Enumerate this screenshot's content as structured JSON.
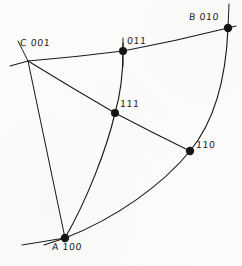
{
  "figure": {
    "kind": "stereographic-projection",
    "background_color": "#fcfcfb",
    "ink_color": "#1b1b1b",
    "width": 242,
    "height": 266
  },
  "poles": [
    {
      "id": "c-001",
      "label": "C 001",
      "index": "001",
      "letter": "C",
      "x": 28,
      "y": 61,
      "marker_radius": 4.0,
      "label_x": 20,
      "label_y": 38
    },
    {
      "id": "011",
      "label": "011",
      "index": "011",
      "letter": "",
      "x": 123,
      "y": 51,
      "marker_radius": 4.0,
      "label_x": 127,
      "label_y": 36
    },
    {
      "id": "b-010",
      "label": "B 010",
      "index": "010",
      "letter": "B",
      "x": 228,
      "y": 28,
      "marker_radius": 4.2,
      "label_x": 189,
      "label_y": 12
    },
    {
      "id": "111",
      "label": "111",
      "index": "111",
      "letter": "",
      "x": 115,
      "y": 113,
      "marker_radius": 4.0,
      "label_x": 120,
      "label_y": 99
    },
    {
      "id": "110",
      "label": "110",
      "index": "110",
      "letter": "",
      "x": 190,
      "y": 151,
      "marker_radius": 4.2,
      "label_x": 196,
      "label_y": 140
    },
    {
      "id": "a-100",
      "label": "A 100",
      "index": "100",
      "letter": "A",
      "x": 65,
      "y": 238,
      "marker_radius": 4.2,
      "label_x": 52,
      "label_y": 242
    }
  ],
  "arcs": [
    {
      "id": "arc-c-011-b",
      "name": "great-circle-c-to-b",
      "from": "c-001",
      "through": "011",
      "to": "b-010",
      "path": "M 10 66 L 28 61 Q 76 57 123 51 Q 176 41 228 28 L 236 26"
    },
    {
      "id": "arc-b-110-a",
      "name": "great-circle-b-to-a",
      "from": "b-010",
      "through": "110",
      "to": "a-100",
      "path": "M 228 28 C 226 78 214 122 190 151 C 163 184 117 218 65 238 L 44 245"
    },
    {
      "id": "arc-011-111-a",
      "name": "great-circle-011-to-a",
      "from": "011",
      "through": "111",
      "to": "a-100",
      "path": "M 123 43 L 123 51 C 123 72 120 96 115 113 C 107 148 87 200 65 238"
    }
  ],
  "lines": [
    {
      "id": "line-c-111-110",
      "name": "zone-line-c-to-110",
      "from": "c-001",
      "through": "111",
      "to": "110",
      "path": "M 28 61 Q 72 88 115 113 Q 153 133 190 151"
    },
    {
      "id": "line-c-a",
      "name": "zone-line-c-to-a",
      "from": "c-001",
      "to": "a-100",
      "path": "M 28 61 L 65 238"
    }
  ],
  "tick_marks": [
    {
      "id": "tick-b-vertical",
      "name": "tick-at-b-010",
      "path": "M 229 4 L 228 28"
    },
    {
      "id": "tick-011-vertical",
      "name": "tick-at-011",
      "path": "M 123 38 L 123 66"
    },
    {
      "id": "tick-c-upleft",
      "name": "tick-at-c-001",
      "path": "M 18 41 L 28 61"
    },
    {
      "id": "tick-a-left",
      "name": "tick-at-a-100",
      "path": "M 22 245 L 65 238"
    }
  ]
}
